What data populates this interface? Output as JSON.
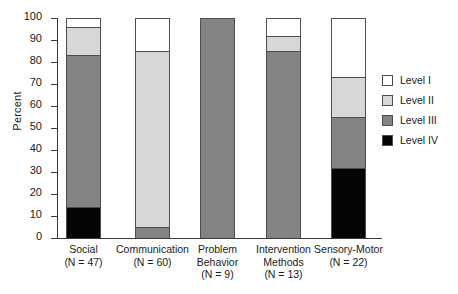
{
  "chart_data": {
    "type": "bar",
    "subtype": "stacked-bar-100-percent",
    "title": "",
    "xlabel": "",
    "ylabel": "Percent",
    "ylim": [
      0,
      100
    ],
    "yticks": [
      0,
      10,
      20,
      30,
      40,
      50,
      60,
      70,
      80,
      90,
      100
    ],
    "grid": false,
    "legend_position": "right",
    "categories": [
      "Social",
      "Communication",
      "Problem Behavior",
      "Intervention Methods",
      "Sensory-Motor"
    ],
    "category_sublabels": [
      "(N = 47)",
      "(N = 60)",
      "(N = 9)",
      "(N = 13)",
      "(N = 22)"
    ],
    "series": [
      {
        "name": "Level I",
        "color": "#ffffff",
        "values": [
          4,
          15,
          0,
          8,
          27
        ]
      },
      {
        "name": "Level II",
        "color": "#d7d7d7",
        "values": [
          13,
          80,
          0,
          7,
          18
        ]
      },
      {
        "name": "Level III",
        "color": "#838383",
        "values": [
          69,
          5,
          100,
          85,
          23
        ]
      },
      {
        "name": "Level IV",
        "color": "#050505",
        "values": [
          14,
          0,
          0,
          0,
          32
        ]
      }
    ],
    "cumulative_tops": {
      "Social": [
        100,
        96,
        83,
        14
      ],
      "Communication": [
        100,
        85,
        5,
        0
      ],
      "Problem Behavior": [
        100,
        100,
        100,
        0
      ],
      "Intervention Methods": [
        100,
        92,
        85,
        0
      ],
      "Sensory-Motor": [
        100,
        73,
        55,
        32
      ]
    }
  },
  "axis": {
    "ylabel": "Percent",
    "tick_labels": [
      "100",
      "90",
      "80",
      "70",
      "60",
      "50",
      "40",
      "30",
      "20",
      "10",
      "0"
    ]
  },
  "legend": {
    "items": [
      {
        "label": "Level I",
        "color": "#ffffff"
      },
      {
        "label": "Level II",
        "color": "#d7d7d7"
      },
      {
        "label": "Level III",
        "color": "#838383"
      },
      {
        "label": "Level IV",
        "color": "#050505"
      }
    ]
  },
  "categories": [
    {
      "name": "Social",
      "n": "(N = 47)"
    },
    {
      "name": "Communication",
      "n": "(N = 60)"
    },
    {
      "name": "Problem Behavior",
      "n": "(N = 9)"
    },
    {
      "name": "Intervention Methods",
      "n": "(N = 13)"
    },
    {
      "name": "Sensory-Motor",
      "n": "(N = 22)"
    }
  ]
}
